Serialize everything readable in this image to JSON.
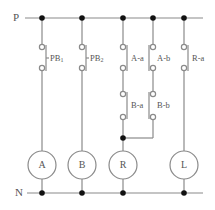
{
  "diagram": {
    "type": "relay-ladder-circuit",
    "rails": {
      "top": {
        "label": "P",
        "y": 18,
        "x_start": 25,
        "x_end": 203
      },
      "bottom": {
        "label": "N",
        "y": 193,
        "x_start": 27,
        "x_end": 203
      }
    },
    "colors": {
      "wire": "#8a8a8a",
      "junction": "#111111",
      "text": "#555555",
      "contact_open": "#ffffff"
    },
    "rungs": [
      {
        "x": 42,
        "coil": "A",
        "contacts": [
          {
            "label": "PB",
            "sub": "1",
            "y1": 47,
            "y2": 68
          }
        ]
      },
      {
        "x": 82,
        "coil": "B",
        "contacts": [
          {
            "label": "PB",
            "sub": "2",
            "y1": 47,
            "y2": 68
          }
        ]
      },
      {
        "x": 123,
        "coil": "R",
        "contacts": [
          {
            "label": "A-a",
            "sub": "",
            "y1": 47,
            "y2": 68
          },
          {
            "label": "B-a",
            "sub": "",
            "y1": 94,
            "y2": 117
          }
        ]
      },
      {
        "x": 153,
        "coil": "",
        "contacts": [
          {
            "label": "A-b",
            "sub": "",
            "y1": 47,
            "y2": 68
          },
          {
            "label": "B-b",
            "sub": "",
            "y1": 94,
            "y2": 117
          }
        ]
      },
      {
        "x": 184,
        "coil": "L",
        "contacts": [
          {
            "label": "R-a",
            "sub": "",
            "y1": 47,
            "y2": 68
          }
        ]
      }
    ],
    "coils": [
      {
        "label": "A",
        "cx": 42,
        "cy": 165,
        "r": 14
      },
      {
        "label": "B",
        "cx": 82,
        "cy": 165,
        "r": 14
      },
      {
        "label": "R",
        "cx": 123,
        "cy": 165,
        "r": 14
      },
      {
        "label": "L",
        "cx": 184,
        "cy": 165,
        "r": 14
      }
    ],
    "labels": {
      "P": "P",
      "N": "N",
      "PB1_main": "PB",
      "PB1_sub": "1",
      "PB2_main": "PB",
      "PB2_sub": "2",
      "Aa": "A-a",
      "Ab": "A-b",
      "Ra": "R-a",
      "Ba": "B-a",
      "Bb": "B-b",
      "coilA": "A",
      "coilB": "B",
      "coilR": "R",
      "coilL": "L"
    }
  }
}
